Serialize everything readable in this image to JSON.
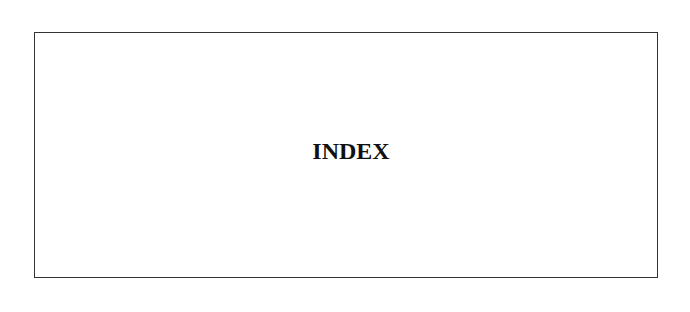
{
  "page": {
    "heading": "INDEX"
  },
  "colors": {
    "border": "#333333",
    "text": "#111111",
    "background": "#ffffff"
  }
}
